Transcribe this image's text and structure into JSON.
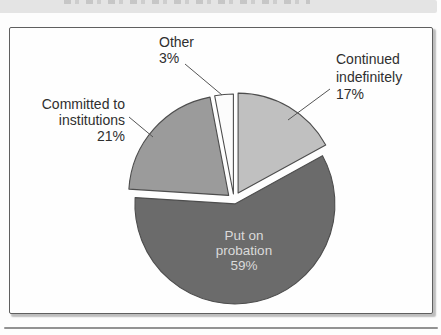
{
  "chart_data": {
    "type": "pie",
    "categories": [
      "Other",
      "Continued indefinitely",
      "Put on probation",
      "Committed to institutions"
    ],
    "ids": [
      "other",
      "continued-indefinitely",
      "put-on-probation",
      "committed-to-institutions"
    ],
    "values": [
      3,
      17,
      59,
      21
    ],
    "unit": "%",
    "colors": [
      "#fcfcfc",
      "#c0c0c0",
      "#6b6b6b",
      "#9b9b9b"
    ],
    "outline_color": "#4d4d4d",
    "start_angle_deg": -10.8,
    "explode_px": [
      6,
      8,
      4,
      7
    ],
    "legend_position": "none",
    "labels": {
      "other": "Other\n3%",
      "continued": "Continued\nindefinitely\n17%",
      "committed": "Committed to\ninstitutions\n21%",
      "probation": "Put on\nprobation\n59%"
    }
  }
}
